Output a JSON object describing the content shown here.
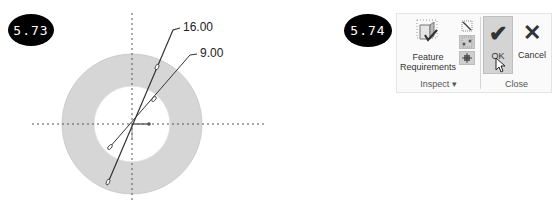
{
  "figures": [
    {
      "badge": "5.73",
      "dimensions": [
        {
          "label": "16.00"
        },
        {
          "label": "9.00"
        }
      ]
    },
    {
      "badge": "5.74",
      "ribbon": {
        "groups": [
          {
            "label": "Inspect ▾",
            "buttons": [
              {
                "label_line1": "Feature",
                "label_line2": "Requirements",
                "icon": "feature-requirements-icon"
              },
              {
                "icon": "small-tool-icon"
              },
              {
                "icon": "small-tool-icon",
                "highlighted": true
              },
              {
                "icon": "small-tool-icon",
                "highlighted": true
              }
            ]
          },
          {
            "label": "Close",
            "buttons": [
              {
                "label": "OK",
                "glyph": "✔",
                "icon": "checkmark-icon",
                "highlighted": true
              },
              {
                "label": "Cancel",
                "glyph": "✕",
                "icon": "close-icon"
              }
            ]
          }
        ]
      }
    }
  ],
  "colors": {
    "badge_bg": "#000000",
    "annulus_fill": "#d6d6d6",
    "line": "#333333",
    "ribbon_bg": "#fafafa",
    "highlight": "#d4d4d4"
  }
}
